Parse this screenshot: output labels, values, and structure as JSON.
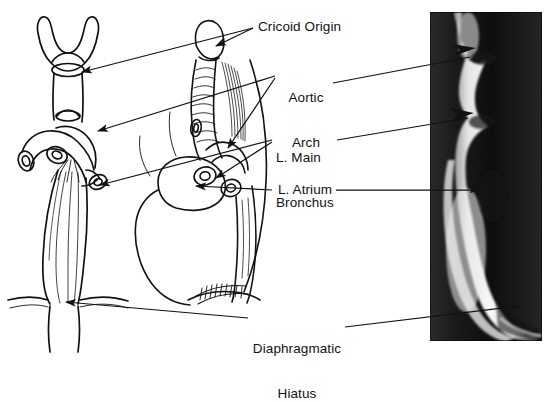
{
  "figure": {
    "type": "anatomy-illustration-with-radiograph",
    "background_color": "#ffffff",
    "ink_color": "#111111"
  },
  "labels": [
    {
      "id": "cricoid-origin",
      "text": "Cricoid Origin",
      "lines": [
        "Cricoid Origin"
      ],
      "x": 258,
      "y": 21
    },
    {
      "id": "aortic-arch",
      "text": "Aortic Arch",
      "lines": [
        "Aortic",
        "Arch"
      ],
      "x": 279,
      "y": 62
    },
    {
      "id": "l-main-bronchus",
      "text": "L. Main Bronchus",
      "lines": [
        "L. Main",
        "Bronchus"
      ],
      "x": 276,
      "y": 122
    },
    {
      "id": "l-atrium",
      "text": "L. Atrium",
      "lines": [
        "L. Atrium"
      ],
      "x": 278,
      "y": 182
    },
    {
      "id": "diaphragmatic-hiatus",
      "text": "Diaphragmatic Hiatus",
      "lines": [
        "Diaphragmatic",
        "Hiatus"
      ],
      "x": 253,
      "y": 313
    }
  ],
  "panels": {
    "left_drawing": {
      "name": "anterior-esophagus-drawing",
      "view": "anterior",
      "structures": [
        "cricoid cartilage",
        "cervical esophagus",
        "trachea",
        "aortic arch",
        "left main bronchus",
        "right main bronchus",
        "thoracic esophagus",
        "diaphragm"
      ]
    },
    "middle_drawing": {
      "name": "lateral-mediastinum-drawing",
      "view": "lateral oblique",
      "structures": [
        "cricoid cartilage",
        "trachea",
        "vertebral column",
        "aortic arch",
        "left main bronchus",
        "left atrium",
        "esophagus",
        "diaphragmatic hiatus"
      ]
    },
    "radiograph": {
      "name": "barium-swallow-radiograph",
      "modality": "barium swallow",
      "projection": "lateral",
      "x": 430,
      "y": 12,
      "width": 112,
      "height": 329,
      "arrow_marks": 4
    }
  },
  "leader_lines": {
    "count": 11,
    "arrow_color": "#111111"
  }
}
